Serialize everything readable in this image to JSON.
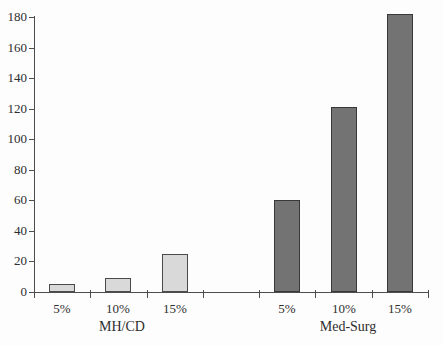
{
  "chart_data": {
    "type": "bar",
    "title": "",
    "xlabel": "",
    "ylabel": "",
    "ylim": [
      0,
      180
    ],
    "ytick_step": 20,
    "ytick_labels": [
      "0",
      "20",
      "40",
      "60",
      "80",
      "100",
      "120",
      "140",
      "160",
      "180"
    ],
    "grid": false,
    "legend_position": "none",
    "groups": [
      {
        "label": "MH/CD",
        "bar_color": "#d9d9d9",
        "bar_border": "#4a4a4a",
        "categories": [
          "5%",
          "10%",
          "15%"
        ],
        "values": [
          5,
          9,
          25
        ]
      },
      {
        "label": "Med-Surg",
        "bar_color": "#737373",
        "bar_border": "#383838",
        "categories": [
          "5%",
          "10%",
          "15%"
        ],
        "values": [
          60,
          121,
          182
        ]
      }
    ]
  },
  "colors": {
    "background": "#fdfdfd",
    "axis": "#4d4d4d",
    "text": "#2e2e2e"
  }
}
